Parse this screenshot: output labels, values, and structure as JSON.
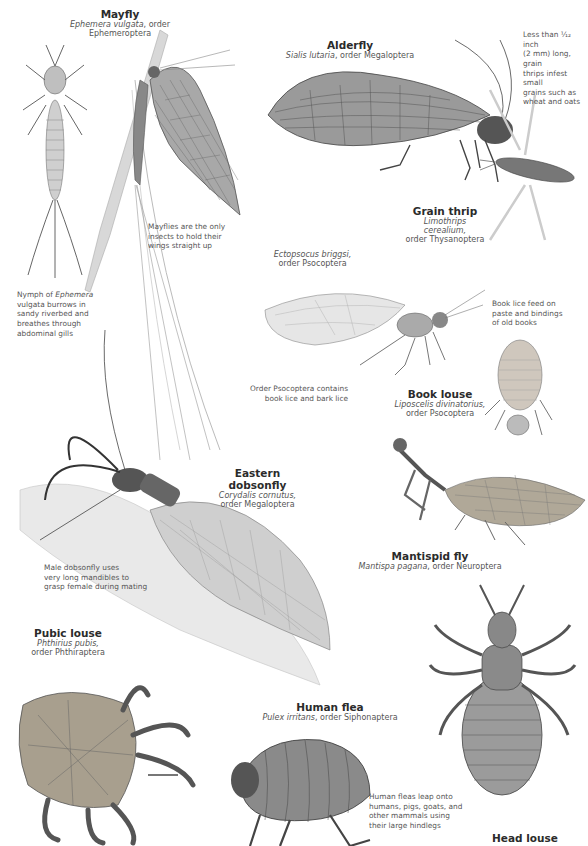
{
  "species": [
    {
      "id": "mayfly",
      "common_name": "Mayfly",
      "scientific_name": "Ephemera vulgata",
      "order": "order Ephemeroptera"
    },
    {
      "id": "alderfly",
      "common_name": "Alderfly",
      "scientific_name": "Sialis lutaria",
      "order": "order Megaloptera"
    },
    {
      "id": "grain-thrip",
      "common_name": "Grain thrip",
      "scientific_name": "Limothrips cerealium,",
      "order": "order Thysanoptera"
    },
    {
      "id": "ectopsocus",
      "common_name": "",
      "scientific_name": "Ectopsocus briggsi,",
      "order": "order Psocoptera"
    },
    {
      "id": "book-louse",
      "common_name": "Book louse",
      "scientific_name": "Liposcelis divinatorius,",
      "order": "order Psocoptera"
    },
    {
      "id": "eastern-dobsonfly",
      "common_name": "Eastern dobsonfly",
      "scientific_name": "Corydalis cornutus,",
      "order": "order Megaloptera"
    },
    {
      "id": "mantispid-fly",
      "common_name": "Mantispid fly",
      "scientific_name": "Mantispa pagana",
      "order": "order Neuroptera"
    },
    {
      "id": "pubic-louse",
      "common_name": "Pubic louse",
      "scientific_name": "Phthirius pubis,",
      "order": "order Phthiraptera"
    },
    {
      "id": "human-flea",
      "common_name": "Human flea",
      "scientific_name": "Pulex irritans",
      "order": "order Siphonaptera"
    },
    {
      "id": "head-louse",
      "common_name": "Head louse"
    }
  ],
  "notes": {
    "grain_thrip_size": [
      "Less than ¹⁄₁₂ inch",
      "(2 mm) long, grain",
      "thrips infest small",
      "grains such as",
      "wheat and oats"
    ],
    "mayfly_wings": [
      "Mayflies are the only",
      "insects to hold their",
      "wings straight up"
    ],
    "mayfly_nymph_pre": "Nymph of ",
    "mayfly_nymph_italic": "Ephemera",
    "mayfly_nymph": [
      "vulgata burrows in",
      "sandy riverbed and",
      "breathes through",
      "abdominal gills"
    ],
    "book_lice_food": [
      "Book lice feed on",
      "paste and bindings",
      "of old books"
    ],
    "psocoptera": [
      "Order Psocoptera contains",
      "book lice and bark lice"
    ],
    "dobsonfly_mandibles": [
      "Male dobsonfly uses",
      "very long mandibles to",
      "grasp female during mating"
    ],
    "human_flea": [
      "Human fleas leap onto",
      "humans, pigs, goats, and",
      "other mammals using",
      "their large hindlegs"
    ]
  },
  "colors": {
    "background": "#ffffff",
    "text": "#3a3a3a",
    "illustration_dark": "#4a4a4a",
    "illustration_mid": "#8a8a8a",
    "illustration_light": "#c8c8c8",
    "stem": "#b8b8b8"
  }
}
